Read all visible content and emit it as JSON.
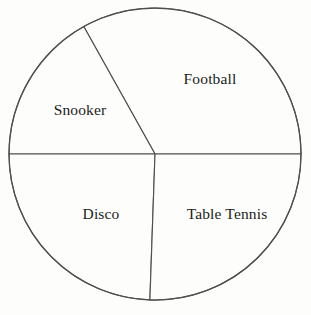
{
  "chart_data": {
    "type": "pie",
    "title": "",
    "subtitle": "",
    "xlabel": "",
    "ylabel": "",
    "legend": "none",
    "grid": false,
    "labels_inside_slices": true,
    "categories": [
      "Football",
      "Snooker",
      "Disco",
      "Table Tennis"
    ],
    "values": [
      119.2,
      60.8,
      88.0,
      92.0
    ],
    "value_unit": "degrees",
    "percentages": [
      33.1,
      16.9,
      24.4,
      25.6
    ],
    "slices": [
      {
        "name": "Football",
        "label": "Football",
        "angle_degrees": 119.2,
        "percent": 33.1,
        "start_angle": 0.0,
        "end_angle": 119.2,
        "fill": "#fdfdfc",
        "stroke": "#4f4f4f",
        "label_x": 210,
        "label_y": 79
      },
      {
        "name": "Snooker",
        "label": "Snooker",
        "angle_degrees": 60.8,
        "percent": 16.9,
        "start_angle": 119.2,
        "end_angle": 180.0,
        "fill": "#fdfdfc",
        "stroke": "#4f4f4f",
        "label_x": 80,
        "label_y": 110
      },
      {
        "name": "Disco",
        "label": "Disco",
        "angle_degrees": 88.0,
        "percent": 24.4,
        "start_angle": 180.0,
        "end_angle": 268.0,
        "fill": "#fdfdfc",
        "stroke": "#4f4f4f",
        "label_x": 101,
        "label_y": 214
      },
      {
        "name": "Table Tennis",
        "label": "Table Tennis",
        "angle_degrees": 92.0,
        "percent": 25.6,
        "start_angle": 268.0,
        "end_angle": 360.0,
        "fill": "#fdfdfc",
        "stroke": "#4f4f4f",
        "label_x": 227,
        "label_y": 214
      }
    ],
    "geometry": {
      "center_x": 155,
      "center_y": 154,
      "radius": 146
    },
    "colors": {
      "background": "#fdfdfc",
      "line": "#4f4f4f",
      "text": "#201d1b"
    }
  }
}
